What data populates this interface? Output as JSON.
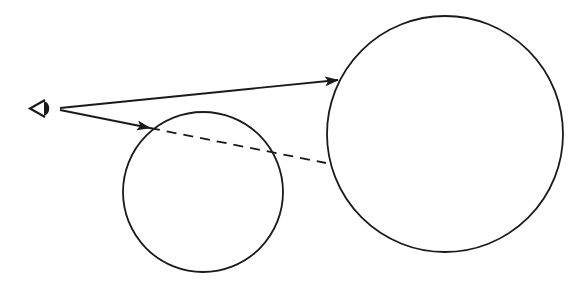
{
  "diagram": {
    "colors": {
      "stroke": "#1a1a1a",
      "background": "#ffffff"
    },
    "eye": {
      "icon": "eye-icon",
      "x": 30,
      "y": 108
    },
    "circles": [
      {
        "name": "small-circle",
        "cx": 203,
        "cy": 192,
        "r": 80
      },
      {
        "name": "large-circle",
        "cx": 445,
        "cy": 134,
        "r": 118
      }
    ],
    "rays": [
      {
        "name": "ray-to-large-circle",
        "x1": 60,
        "y1": 108,
        "x2": 338,
        "y2": 80,
        "style": "solid",
        "arrow": true
      },
      {
        "name": "ray-to-small-circle",
        "x1": 60,
        "y1": 110,
        "x2": 150,
        "y2": 128,
        "style": "solid",
        "arrow": true
      },
      {
        "name": "occluded-ray",
        "x1": 150,
        "y1": 128,
        "x2": 326,
        "y2": 163,
        "style": "dashed",
        "arrow": false
      }
    ]
  }
}
